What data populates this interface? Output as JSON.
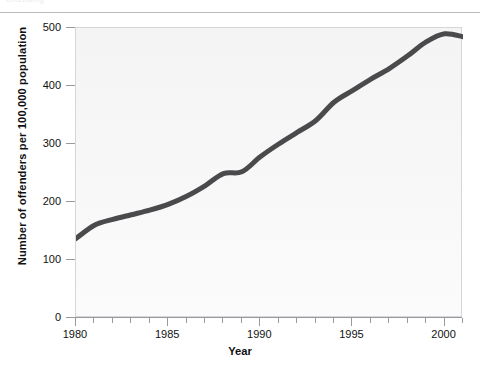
{
  "page": {
    "top_ghost_text": "Offending",
    "background_color": "#ffffff"
  },
  "chart_data": {
    "type": "line",
    "title": "",
    "xlabel": "Year",
    "ylabel": "Number of offenders per 100,000 population",
    "xlim": [
      1980,
      2001
    ],
    "ylim": [
      0,
      500
    ],
    "ytick_values": [
      0,
      100,
      200,
      300,
      400,
      500
    ],
    "ytick_labels": [
      "0",
      "100",
      "200",
      "300",
      "400",
      "500"
    ],
    "xtick_major_values": [
      1980,
      1985,
      1990,
      1995,
      2000
    ],
    "xtick_major_labels": [
      "1980",
      "1985",
      "1990",
      "1995",
      "2000"
    ],
    "xtick_minor_step": 1,
    "grid": false,
    "legend": false,
    "series": [
      {
        "name": "Offenders per 100,000 population",
        "color": "#4a4a4c",
        "line_width": 5,
        "x": [
          1980,
          1981,
          1982,
          1983,
          1984,
          1985,
          1986,
          1987,
          1988,
          1989,
          1990,
          1991,
          1992,
          1993,
          1994,
          1995,
          1996,
          1997,
          1998,
          1999,
          2000,
          2001
        ],
        "values": [
          137,
          160,
          170,
          178,
          186,
          196,
          210,
          228,
          249,
          252,
          278,
          300,
          320,
          340,
          372,
          392,
          412,
          430,
          452,
          476,
          490,
          485
        ]
      }
    ]
  },
  "axes": {
    "y_title": "Number of offenders per 100,000 population",
    "x_title": "Year"
  }
}
